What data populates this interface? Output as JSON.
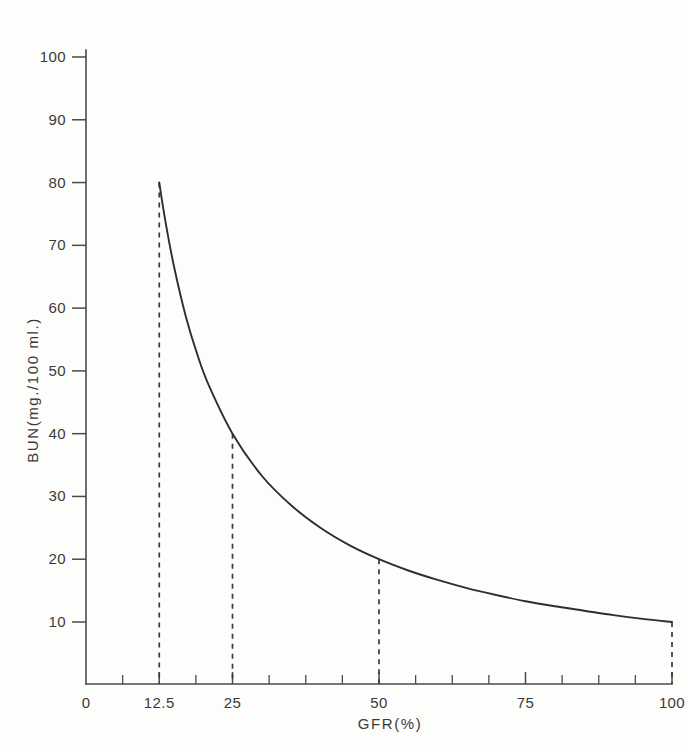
{
  "chart_data": {
    "type": "line",
    "title": "",
    "xlabel": "GFR(%)",
    "ylabel": "BUN(mg./100 ml.)",
    "xlim": [
      0,
      100
    ],
    "ylim": [
      0,
      105
    ],
    "grid": false,
    "legend": "none",
    "relationship": "BUN = 1000 / GFR",
    "x_ticks_major": [
      0,
      12.5,
      25,
      50,
      75,
      100
    ],
    "x_tick_labels": [
      "0",
      "12.5",
      "25",
      "50",
      "75",
      "100"
    ],
    "x_ticks_minor": [
      6.25,
      18.75,
      31.25,
      37.5,
      43.75,
      56.25,
      62.5,
      68.75,
      81.25,
      87.5,
      93.75
    ],
    "y_ticks_major": [
      10,
      20,
      30,
      40,
      50,
      60,
      70,
      80,
      90,
      100
    ],
    "y_tick_labels": [
      "10",
      "20",
      "30",
      "40",
      "50",
      "60",
      "70",
      "80",
      "90",
      "100"
    ],
    "series": [
      {
        "name": "BUN vs GFR",
        "x": [
          12.5,
          13.5,
          15,
          17,
          19,
          21,
          25,
          30,
          35,
          40,
          45,
          50,
          55,
          60,
          65,
          70,
          75,
          80,
          85,
          90,
          95,
          100
        ],
        "values": [
          80,
          74.1,
          66.7,
          58.8,
          52.6,
          47.6,
          40,
          33.3,
          28.6,
          25,
          22.2,
          20,
          18.2,
          16.7,
          15.4,
          14.3,
          13.3,
          12.5,
          11.8,
          11.1,
          10.5,
          10
        ]
      }
    ],
    "annotated_points": [
      {
        "x": 12.5,
        "y": 80,
        "leader": "dashed-to-x-axis"
      },
      {
        "x": 25,
        "y": 40,
        "leader": "dashed-to-x-axis"
      },
      {
        "x": 50,
        "y": 20,
        "leader": "dashed-to-x-axis"
      },
      {
        "x": 100,
        "y": 10,
        "leader": "dashed-to-x-axis"
      }
    ]
  },
  "colors": {
    "background": "#fdfdfc",
    "curve": "#2e2e2c",
    "axis": "#4a4a48",
    "text": "#3a3a38",
    "leader": "#3a3a38"
  }
}
